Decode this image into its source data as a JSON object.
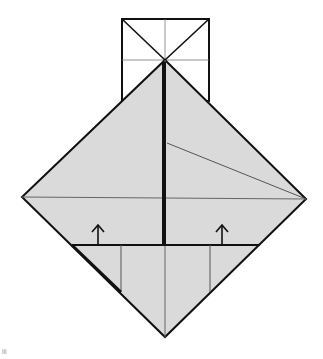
{
  "diagram": {
    "type": "origami-fold-diagram",
    "colors": {
      "paper_fill": "#dadada",
      "line_dark": "#111111",
      "line_thin": "#555555",
      "background": "#ffffff"
    },
    "arrows": [
      {
        "name": "fold-up-arrow-left",
        "direction": "up"
      },
      {
        "name": "fold-up-arrow-right",
        "direction": "up"
      }
    ],
    "caption": "iii"
  }
}
